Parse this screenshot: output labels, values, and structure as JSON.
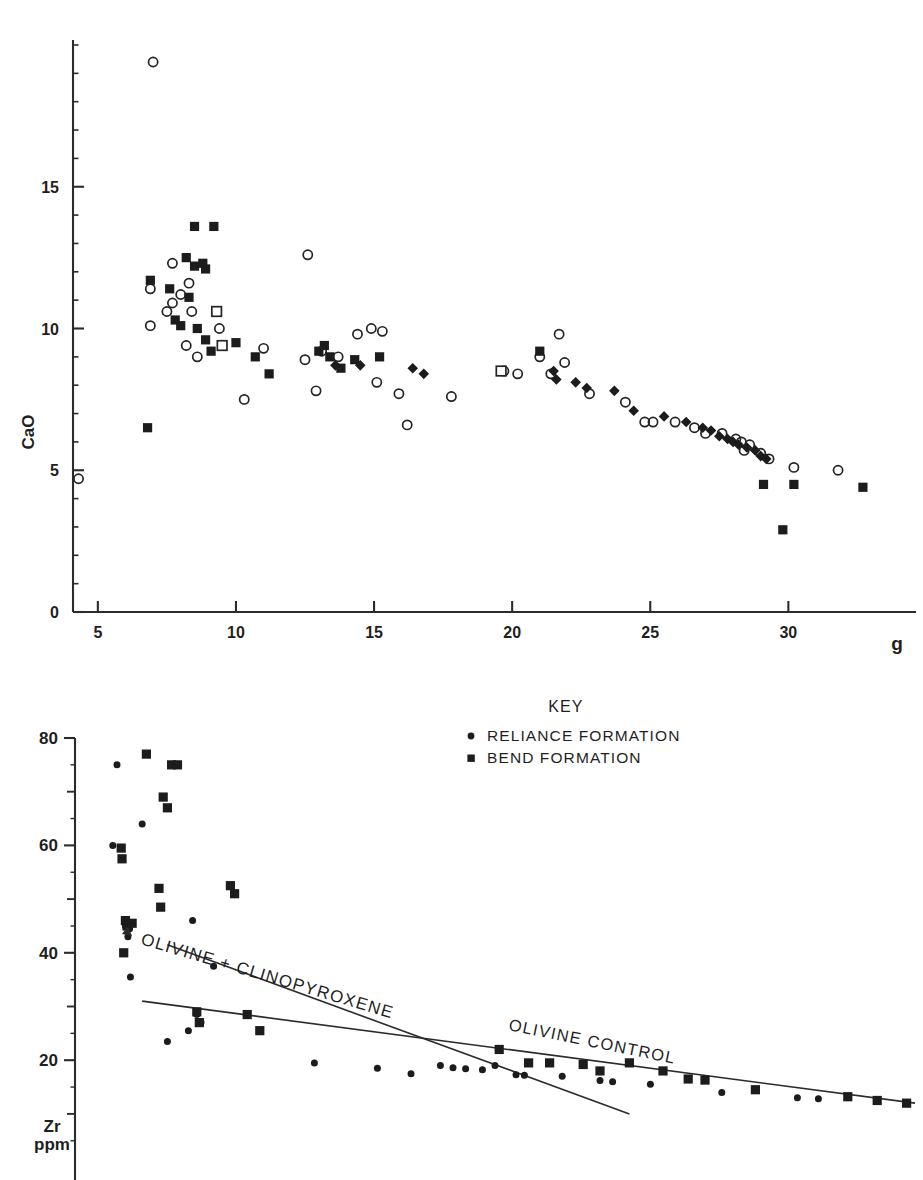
{
  "figure": {
    "name": "geochemical-variation-diagrams",
    "panels": [
      "cao-vs-mgo",
      "zr-vs-mgo"
    ]
  },
  "chart_data": [
    {
      "type": "scatter",
      "name": "CaO variation diagram",
      "title": "",
      "xlabel": "g",
      "ylabel": "CaO",
      "xlim": [
        4.1,
        33.4
      ],
      "ylim": [
        0,
        20.2
      ],
      "xticks": [
        5,
        10,
        15,
        20,
        25,
        30
      ],
      "yticks": [
        0,
        5,
        10,
        15
      ],
      "xtick_labels": [
        "5",
        "10",
        "15",
        "20",
        "25",
        "30"
      ],
      "ytick_labels": [
        "0",
        "5",
        "10",
        "15"
      ],
      "grid": false,
      "legend": "none",
      "minor_ticks_y": [
        1,
        2,
        3,
        4,
        6,
        7,
        8,
        9,
        11,
        12,
        13,
        14,
        16,
        17,
        18,
        19,
        20
      ],
      "series": [
        {
          "name": "open circle",
          "marker": "open-circle",
          "points": [
            [
              4.3,
              4.7
            ],
            [
              7.0,
              19.4
            ],
            [
              6.9,
              11.4
            ],
            [
              6.9,
              10.1
            ],
            [
              7.5,
              10.6
            ],
            [
              7.7,
              12.3
            ],
            [
              7.7,
              10.9
            ],
            [
              8.0,
              11.2
            ],
            [
              8.3,
              11.6
            ],
            [
              8.4,
              10.6
            ],
            [
              8.2,
              9.4
            ],
            [
              8.6,
              9.0
            ],
            [
              9.4,
              10.0
            ],
            [
              10.3,
              7.5
            ],
            [
              11.0,
              9.3
            ],
            [
              12.5,
              8.9
            ],
            [
              12.6,
              12.6
            ],
            [
              12.9,
              7.8
            ],
            [
              13.1,
              9.2
            ],
            [
              13.7,
              9.0
            ],
            [
              14.4,
              9.8
            ],
            [
              14.9,
              10.0
            ],
            [
              15.3,
              9.9
            ],
            [
              15.1,
              8.1
            ],
            [
              15.9,
              7.7
            ],
            [
              16.2,
              6.6
            ],
            [
              17.8,
              7.6
            ],
            [
              19.7,
              8.5
            ],
            [
              20.2,
              8.4
            ],
            [
              21.0,
              9.0
            ],
            [
              21.4,
              8.4
            ],
            [
              21.7,
              9.8
            ],
            [
              21.9,
              8.8
            ],
            [
              22.8,
              7.7
            ],
            [
              24.1,
              7.4
            ],
            [
              24.8,
              6.7
            ],
            [
              25.1,
              6.7
            ],
            [
              25.9,
              6.7
            ],
            [
              26.6,
              6.5
            ],
            [
              27.0,
              6.3
            ],
            [
              27.6,
              6.3
            ],
            [
              28.1,
              6.1
            ],
            [
              28.3,
              6.0
            ],
            [
              28.6,
              5.9
            ],
            [
              28.4,
              5.7
            ],
            [
              29.0,
              5.6
            ],
            [
              29.3,
              5.4
            ],
            [
              30.2,
              5.1
            ],
            [
              31.8,
              5.0
            ]
          ]
        },
        {
          "name": "filled square",
          "marker": "filled-square",
          "points": [
            [
              6.8,
              6.5
            ],
            [
              6.9,
              11.7
            ],
            [
              7.6,
              11.4
            ],
            [
              7.8,
              10.3
            ],
            [
              8.0,
              10.1
            ],
            [
              8.3,
              11.1
            ],
            [
              8.5,
              12.2
            ],
            [
              8.5,
              13.6
            ],
            [
              8.2,
              12.5
            ],
            [
              8.8,
              12.3
            ],
            [
              8.9,
              12.1
            ],
            [
              9.2,
              13.6
            ],
            [
              8.6,
              10.0
            ],
            [
              8.9,
              9.6
            ],
            [
              9.1,
              9.2
            ],
            [
              10.0,
              9.5
            ],
            [
              10.7,
              9.0
            ],
            [
              11.2,
              8.4
            ],
            [
              13.0,
              9.2
            ],
            [
              13.2,
              9.4
            ],
            [
              13.4,
              9.0
            ],
            [
              13.8,
              8.6
            ],
            [
              14.3,
              8.9
            ],
            [
              15.2,
              9.0
            ],
            [
              21.0,
              9.2
            ],
            [
              29.1,
              4.5
            ],
            [
              30.2,
              4.5
            ],
            [
              29.8,
              2.9
            ],
            [
              32.7,
              4.4
            ]
          ]
        },
        {
          "name": "open square",
          "marker": "open-square",
          "points": [
            [
              9.3,
              10.6
            ],
            [
              9.5,
              9.4
            ],
            [
              19.6,
              8.5
            ]
          ]
        },
        {
          "name": "filled diamond",
          "marker": "filled-diamond",
          "points": [
            [
              13.6,
              8.7
            ],
            [
              14.5,
              8.7
            ],
            [
              16.4,
              8.6
            ],
            [
              16.8,
              8.4
            ],
            [
              21.5,
              8.5
            ],
            [
              21.6,
              8.2
            ],
            [
              22.3,
              8.1
            ],
            [
              22.7,
              7.9
            ],
            [
              23.7,
              7.8
            ],
            [
              24.4,
              7.1
            ],
            [
              25.5,
              6.9
            ],
            [
              26.3,
              6.7
            ],
            [
              26.9,
              6.5
            ],
            [
              27.2,
              6.4
            ],
            [
              27.5,
              6.2
            ],
            [
              27.8,
              6.1
            ],
            [
              28.0,
              6.0
            ],
            [
              28.2,
              5.9
            ],
            [
              28.5,
              5.8
            ],
            [
              28.8,
              5.7
            ],
            [
              29.0,
              5.5
            ],
            [
              29.2,
              5.4
            ]
          ]
        }
      ]
    },
    {
      "type": "scatter",
      "name": "Zr variation diagram",
      "title": "",
      "xlabel": "",
      "ylabel": "Zr ppm",
      "ylabel_lines": [
        "Zr",
        "ppm"
      ],
      "xlim": [
        0,
        100
      ],
      "ylim": [
        2,
        84
      ],
      "yticks": [
        20,
        40,
        60,
        80
      ],
      "ytick_labels": [
        "20",
        "40",
        "60",
        "80"
      ],
      "minor_ticks_y": [
        10,
        30,
        50,
        70
      ],
      "grid": false,
      "legend": {
        "title": "KEY",
        "entries": [
          {
            "marker": "filled-circle",
            "label": "RELIANCE FORMATION"
          },
          {
            "marker": "filled-square",
            "label": "BEND FORMATION"
          }
        ]
      },
      "annotations": [
        {
          "text": "OLIVINE + CLINOPYROXENE",
          "arrow": "left",
          "rotation": -18
        },
        {
          "text": "OLIVINE CONTROL",
          "rotation": -13
        }
      ],
      "series": [
        {
          "name": "RELIANCE FORMATION",
          "marker": "filled-circle",
          "points": [
            [
              5.0,
              75.0
            ],
            [
              4.5,
              60.0
            ],
            [
              8.0,
              64.0
            ],
            [
              6.0,
              45.0
            ],
            [
              6.5,
              44.5
            ],
            [
              6.3,
              43.0
            ],
            [
              6.6,
              35.5
            ],
            [
              14.0,
              46.0
            ],
            [
              16.5,
              37.5
            ],
            [
              11.0,
              23.5
            ],
            [
              13.5,
              25.5
            ],
            [
              14.5,
              28.5
            ],
            [
              15.0,
              27.0
            ],
            [
              28.5,
              19.5
            ],
            [
              36.0,
              18.5
            ],
            [
              40.0,
              17.5
            ],
            [
              43.5,
              19.0
            ],
            [
              45.0,
              18.6
            ],
            [
              46.5,
              18.4
            ],
            [
              48.5,
              18.2
            ],
            [
              50.0,
              19.0
            ],
            [
              52.5,
              17.3
            ],
            [
              53.5,
              17.2
            ],
            [
              58.0,
              17.0
            ],
            [
              62.5,
              16.2
            ],
            [
              64.0,
              16.0
            ],
            [
              68.5,
              15.5
            ],
            [
              77.0,
              14.0
            ],
            [
              86.0,
              13.0
            ],
            [
              88.5,
              12.8
            ]
          ]
        },
        {
          "name": "BEND FORMATION",
          "marker": "filled-square",
          "points": [
            [
              8.5,
              77.0
            ],
            [
              11.5,
              75.0
            ],
            [
              12.2,
              75.0
            ],
            [
              5.5,
              59.5
            ],
            [
              5.6,
              57.5
            ],
            [
              10.5,
              69.0
            ],
            [
              11.0,
              67.0
            ],
            [
              6.0,
              46.0
            ],
            [
              6.2,
              45.0
            ],
            [
              5.8,
              40.0
            ],
            [
              6.8,
              45.5
            ],
            [
              10.0,
              52.0
            ],
            [
              10.2,
              48.5
            ],
            [
              18.5,
              52.5
            ],
            [
              19.0,
              51.0
            ],
            [
              14.5,
              29.0
            ],
            [
              14.8,
              27.0
            ],
            [
              20.5,
              28.5
            ],
            [
              22.0,
              25.5
            ],
            [
              50.5,
              22.0
            ],
            [
              54.0,
              19.5
            ],
            [
              56.5,
              19.5
            ],
            [
              60.5,
              19.2
            ],
            [
              62.5,
              18.0
            ],
            [
              66.0,
              19.5
            ],
            [
              70.0,
              18.0
            ],
            [
              73.0,
              16.5
            ],
            [
              75.0,
              16.3
            ],
            [
              81.0,
              14.5
            ],
            [
              92.0,
              13.2
            ],
            [
              95.5,
              12.5
            ],
            [
              99.0,
              12.0
            ]
          ]
        }
      ],
      "trendlines": [
        {
          "name": "olivine-clinopyroxene-arrow",
          "x0": 11.0,
          "y0": 41.5,
          "x1": 66.0,
          "y1": 10.0
        },
        {
          "name": "olivine-control",
          "x0": 8.0,
          "y0": 31.0,
          "x1": 100.0,
          "y1": 12.0
        }
      ]
    }
  ],
  "upper_panel": {
    "y_axis_title": "CaO",
    "x_axis_title": "g",
    "x_tick_labels": [
      "5",
      "10",
      "15",
      "20",
      "25",
      "30"
    ],
    "y_tick_labels": [
      "0",
      "5",
      "10",
      "15"
    ]
  },
  "lower_panel": {
    "y_axis_title_line1": "Zr",
    "y_axis_title_line2": "ppm",
    "y_tick_labels": [
      "20",
      "40",
      "60",
      "80"
    ],
    "key": {
      "title": "KEY",
      "item1": "RELIANCE FORMATION",
      "item2": "BEND FORMATION"
    },
    "annotation_olivine_cpx": "OLIVINE + CLINOPYROXENE",
    "annotation_olivine_control": "OLIVINE CONTROL"
  },
  "colors": {
    "ink": "#1c1c1c",
    "axis": "#2b2b2b",
    "background": "#ffffff"
  }
}
